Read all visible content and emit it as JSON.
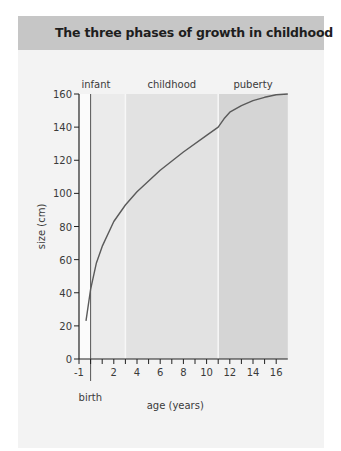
{
  "header": {
    "title": "The three phases of growth in childhood"
  },
  "chart_data": {
    "type": "line",
    "title": "The three phases of growth in childhood",
    "xlabel": "age  (years)",
    "ylabel": "size (cm)",
    "xlim": [
      -1,
      17
    ],
    "ylim": [
      0,
      160
    ],
    "x_ticks": [
      "-1",
      "2",
      "4",
      "6",
      "8",
      "10",
      "12",
      "14",
      "16"
    ],
    "y_ticks": [
      "0",
      "20",
      "40",
      "60",
      "80",
      "100",
      "120",
      "140",
      "160"
    ],
    "annotations": {
      "birth_marker": "birth",
      "birth_x": 0
    },
    "phases": [
      {
        "name": "infant",
        "start": 0,
        "end": 3,
        "color": "#ebebeb"
      },
      {
        "name": "childhood",
        "start": 3,
        "end": 11,
        "color": "#e2e2e2"
      },
      {
        "name": "puberty",
        "start": 11,
        "end": 17,
        "color": "#d5d5d5"
      }
    ],
    "series": [
      {
        "name": "growth",
        "color": "#5a5a5a",
        "x": [
          -0.4,
          0,
          0.5,
          1,
          2,
          3,
          4,
          6,
          8,
          10,
          11,
          11.5,
          12,
          13,
          14,
          15,
          16,
          17
        ],
        "y": [
          23,
          42,
          58,
          68,
          83,
          93,
          101,
          114,
          125,
          135,
          140,
          145,
          149,
          153,
          156,
          158,
          159.5,
          160
        ]
      }
    ],
    "grid": false,
    "legend": null
  }
}
